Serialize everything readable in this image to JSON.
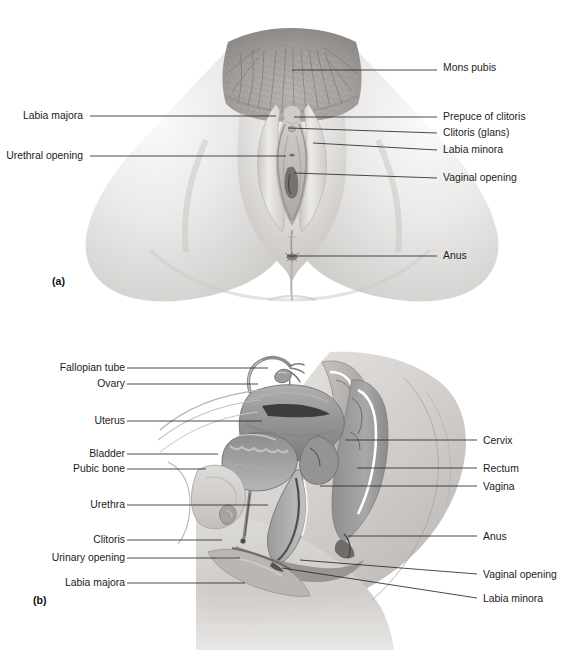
{
  "figure": {
    "background_color": "#ffffff",
    "label_color": "#1c1c1c",
    "leader_color": "#2b2b2b",
    "skin_light": "#f0efee",
    "skin_mid": "#d9d7d5",
    "skin_shadow": "#b9b6b3",
    "tissue_gray": "#9a9a9a",
    "tissue_dark": "#5e5e5e",
    "tissue_darkest": "#3a3a3a",
    "highlight_white": "#ffffff"
  },
  "panels": [
    {
      "id": "a",
      "marker": "(a)",
      "marker_x": 52,
      "marker_y": 285,
      "view": "external-genitalia-front",
      "labels_left": [
        {
          "text": "Labia majora",
          "x": 83,
          "y": 119,
          "anchor": "end",
          "line": [
            [
              90,
              116
            ],
            [
              276,
              116
            ]
          ]
        },
        {
          "text": "Urethral opening",
          "x": 83,
          "y": 159,
          "anchor": "end",
          "line": [
            [
              90,
              156
            ],
            [
              286,
              156
            ]
          ]
        }
      ],
      "labels_right": [
        {
          "text": "Mons pubis",
          "x": 443,
          "y": 71,
          "anchor": "start",
          "line": [
            [
              292,
              70
            ],
            [
              437,
              70
            ]
          ]
        },
        {
          "text": "Prepuce of clitoris",
          "x": 443,
          "y": 120,
          "anchor": "start",
          "line": [
            [
              294,
              117
            ],
            [
              437,
              117
            ]
          ]
        },
        {
          "text": "Clitoris (glans)",
          "x": 443,
          "y": 136,
          "anchor": "start",
          "line": [
            [
              288,
              128
            ],
            [
              437,
              133
            ]
          ]
        },
        {
          "text": "Labia minora",
          "x": 443,
          "y": 153,
          "anchor": "start",
          "line": [
            [
              313,
              143
            ],
            [
              437,
              150
            ]
          ]
        },
        {
          "text": "Vaginal opening",
          "x": 443,
          "y": 181,
          "anchor": "start",
          "line": [
            [
              294,
              173
            ],
            [
              437,
              178
            ]
          ]
        },
        {
          "text": "Anus",
          "x": 443,
          "y": 259,
          "anchor": "start",
          "line": [
            [
              287,
              256
            ],
            [
              437,
              256
            ]
          ]
        }
      ]
    },
    {
      "id": "b",
      "marker": "(b)",
      "marker_x": 33,
      "marker_y": 604,
      "view": "sagittal-section",
      "labels_left": [
        {
          "text": "Fallopian tube",
          "x": 125,
          "y": 371,
          "anchor": "end",
          "line": [
            [
              127,
              368
            ],
            [
              268,
              368
            ]
          ]
        },
        {
          "text": "Ovary",
          "x": 125,
          "y": 387,
          "anchor": "end",
          "line": [
            [
              127,
              384
            ],
            [
              258,
              384
            ]
          ]
        },
        {
          "text": "Uterus",
          "x": 125,
          "y": 424,
          "anchor": "end",
          "line": [
            [
              127,
              421
            ],
            [
              262,
              421
            ]
          ]
        },
        {
          "text": "Bladder",
          "x": 125,
          "y": 457,
          "anchor": "end",
          "line": [
            [
              127,
              454
            ],
            [
              218,
              454
            ]
          ]
        },
        {
          "text": "Pubic bone",
          "x": 125,
          "y": 472,
          "anchor": "end",
          "line": [
            [
              127,
              469
            ],
            [
              206,
              469
            ]
          ]
        },
        {
          "text": "Urethra",
          "x": 125,
          "y": 508,
          "anchor": "end",
          "line": [
            [
              127,
              505
            ],
            [
              268,
              505
            ]
          ]
        },
        {
          "text": "Clitoris",
          "x": 125,
          "y": 543,
          "anchor": "end",
          "line": [
            [
              127,
              540
            ],
            [
              222,
              540
            ]
          ]
        },
        {
          "text": "Urinary opening",
          "x": 125,
          "y": 561,
          "anchor": "end",
          "line": [
            [
              127,
              558
            ],
            [
              240,
              558
            ]
          ]
        },
        {
          "text": "Labia majora",
          "x": 125,
          "y": 586,
          "anchor": "end",
          "line": [
            [
              127,
              583
            ],
            [
              245,
              583
            ]
          ]
        }
      ],
      "labels_right": [
        {
          "text": "Cervix",
          "x": 483,
          "y": 444,
          "anchor": "start",
          "line": [
            [
              345,
              440
            ],
            [
              477,
              440
            ]
          ]
        },
        {
          "text": "Rectum",
          "x": 483,
          "y": 472,
          "anchor": "start",
          "line": [
            [
              357,
              468
            ],
            [
              477,
              468
            ]
          ]
        },
        {
          "text": "Vagina",
          "x": 483,
          "y": 490,
          "anchor": "start",
          "line": [
            [
              320,
              486
            ],
            [
              477,
              486
            ]
          ]
        },
        {
          "text": "Anus",
          "x": 483,
          "y": 540,
          "anchor": "start",
          "line": [
            [
              348,
              536
            ],
            [
              477,
              536
            ]
          ]
        },
        {
          "text": "Vaginal opening",
          "x": 483,
          "y": 578,
          "anchor": "start",
          "line": [
            [
              300,
              560
            ],
            [
              477,
              574
            ]
          ]
        },
        {
          "text": "Labia minora",
          "x": 483,
          "y": 602,
          "anchor": "start",
          "line": [
            [
              282,
              568
            ],
            [
              477,
              598
            ]
          ]
        }
      ]
    }
  ]
}
